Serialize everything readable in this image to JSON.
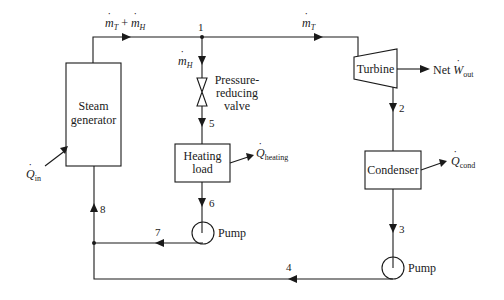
{
  "diagram": {
    "type": "cogeneration-plant-schematic",
    "components": {
      "steam_generator": {
        "line1": "Steam",
        "line2": "generator"
      },
      "turbine": {
        "label": "Turbine"
      },
      "condenser": {
        "label": "Condenser"
      },
      "heating_load": {
        "line1": "Heating",
        "line2": "load"
      },
      "valve": {
        "line1": "Pressure-",
        "line2": "reducing",
        "line3": "valve"
      },
      "pump_process": {
        "label": "Pump"
      },
      "pump_condenser": {
        "label": "Pump"
      }
    },
    "flows": {
      "total": {
        "m1": "m",
        "s1": "T",
        "plus": "+",
        "m2": "m",
        "s2": "H"
      },
      "turbine": {
        "m": "m",
        "s": "T"
      },
      "heating": {
        "m": "m",
        "s": "H"
      }
    },
    "energy": {
      "q_in": {
        "sym": "Q",
        "sub": "in"
      },
      "w_out": {
        "prefix": "Net",
        "sym": "W",
        "sub": "out"
      },
      "q_heating": {
        "sym": "Q",
        "sub": "heating"
      },
      "q_cond": {
        "sym": "Q",
        "sub": "cond"
      }
    },
    "states": [
      "1",
      "2",
      "3",
      "4",
      "5",
      "6",
      "7",
      "8"
    ],
    "colors": {
      "line": "#1a1a1a",
      "background": "#ffffff"
    }
  }
}
